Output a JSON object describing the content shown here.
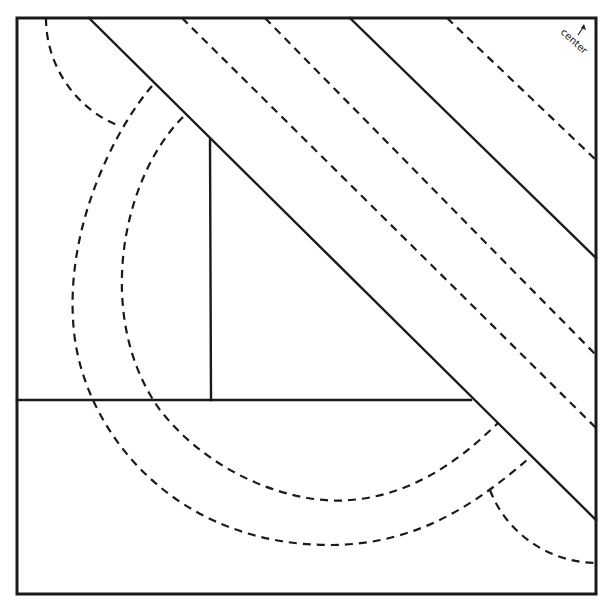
{
  "diagram": {
    "type": "quilt-block-pattern",
    "corner_label": "center",
    "corner_arrow": "arrow-up-icon",
    "line_color": "#1a1a1a",
    "background": "#ffffff",
    "elements": [
      {
        "name": "outer-frame",
        "style": "solid"
      },
      {
        "name": "diagonal-band-lower-edge",
        "style": "solid"
      },
      {
        "name": "diagonal-band-upper-edge",
        "style": "solid"
      },
      {
        "name": "diagonal-seam-1",
        "style": "dashed"
      },
      {
        "name": "diagonal-seam-2",
        "style": "dashed"
      },
      {
        "name": "diagonal-seam-3",
        "style": "dashed"
      },
      {
        "name": "horizontal-divider",
        "style": "solid"
      },
      {
        "name": "vertical-divider",
        "style": "solid"
      },
      {
        "name": "inner-arc",
        "style": "dashed"
      },
      {
        "name": "outer-arc",
        "style": "dashed"
      },
      {
        "name": "top-left-small-arc",
        "style": "dashed"
      },
      {
        "name": "bottom-right-small-arc",
        "style": "dashed"
      }
    ]
  }
}
